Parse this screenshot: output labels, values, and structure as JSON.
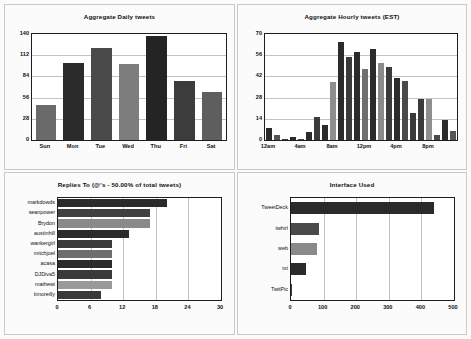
{
  "page": {
    "background": "#fbfbfb",
    "panel_border": "#c9c9c9"
  },
  "palette": {
    "dark": "#2b2b2b",
    "mid": "#565656",
    "light": "#8e8e8e",
    "axis": "#1d1d1d",
    "grid": "#c3c3c3"
  },
  "chart_data": [
    {
      "id": "aggregate-daily-tweets",
      "type": "bar",
      "orientation": "vertical",
      "title": "Aggregate Daily tweets",
      "xlabel": "",
      "ylabel": "",
      "categories": [
        "Sun",
        "Mon",
        "Tue",
        "Wed",
        "Thu",
        "Fri",
        "Sat"
      ],
      "values": [
        46,
        102,
        122,
        101,
        138,
        78,
        63
      ],
      "colors": [
        "#6a6a6a",
        "#2b2b2b",
        "#4a4a4a",
        "#7d7d7d",
        "#242424",
        "#3c3c3c",
        "#5e5e5e"
      ],
      "ylim": [
        0,
        140
      ],
      "yticks": [
        0,
        28,
        56,
        84,
        112,
        140
      ],
      "ytick_labels": [
        "0",
        "28",
        "56",
        "84",
        "112",
        "140"
      ],
      "grid": true,
      "legend": false
    },
    {
      "id": "aggregate-hourly-tweets",
      "type": "bar",
      "orientation": "vertical",
      "title": "Aggregate Hourly tweets (EST)",
      "xlabel": "",
      "ylabel": "",
      "categories": [
        "12am",
        "1am",
        "2am",
        "3am",
        "4am",
        "5am",
        "6am",
        "7am",
        "8am",
        "9am",
        "10am",
        "11am",
        "12pm",
        "1pm",
        "2pm",
        "3pm",
        "4pm",
        "5pm",
        "6pm",
        "7pm",
        "8pm",
        "9pm",
        "10pm",
        "11pm"
      ],
      "values": [
        8,
        3,
        1,
        2,
        1,
        5,
        15,
        10,
        38,
        65,
        55,
        58,
        47,
        60,
        51,
        48,
        41,
        39,
        18,
        27,
        27,
        3,
        13,
        6
      ],
      "colors": [
        "#2b2b2b",
        "#555555",
        "#3a3a3a",
        "#2b2b2b",
        "#4a4a4a",
        "#2b2b2b",
        "#3a3a3a",
        "#2b2b2b",
        "#8e8e8e",
        "#2b2b2b",
        "#3a3a3a",
        "#2b2b2b",
        "#6f6f6f",
        "#2b2b2b",
        "#8a8a8a",
        "#3a3a3a",
        "#2b2b2b",
        "#4a4a4a",
        "#3a3a3a",
        "#3a3a3a",
        "#8e8e8e",
        "#4a4a4a",
        "#2b2b2b",
        "#555555"
      ],
      "ylim": [
        0,
        70
      ],
      "yticks": [
        0,
        14,
        28,
        42,
        56,
        70
      ],
      "ytick_labels": [
        "0",
        "14",
        "28",
        "42",
        "56",
        "70"
      ],
      "xtick_labels": [
        "12am",
        "4am",
        "8am",
        "12pm",
        "4pm",
        "8pm"
      ],
      "xtick_indices": [
        0,
        4,
        8,
        12,
        16,
        20
      ],
      "grid": true,
      "legend": false
    },
    {
      "id": "replies-to",
      "type": "bar",
      "orientation": "horizontal",
      "title": "Replies To (@'s - 50.00% of total tweets)",
      "xlabel": "",
      "ylabel": "",
      "categories": [
        "markdowds",
        "seanpower",
        "Brydon",
        "austinhill",
        "wankergirl",
        "mitchjoel",
        "acasa",
        "DJDiva5",
        "mathewi",
        "timoreilly"
      ],
      "values": [
        20,
        17,
        17,
        13,
        10,
        10,
        10,
        10,
        10,
        8
      ],
      "colors": [
        "#2b2b2b",
        "#3f3f3f",
        "#8a8a8a",
        "#2b2b2b",
        "#3a3a3a",
        "#6e6e6e",
        "#2b2b2b",
        "#3a3a3a",
        "#9a9a9a",
        "#3a3a3a"
      ],
      "xlim": [
        0,
        30
      ],
      "xticks": [
        0,
        6,
        12,
        18,
        24,
        30
      ],
      "xtick_labels": [
        "0",
        "6",
        "12",
        "18",
        "24",
        "30"
      ],
      "grid": true,
      "legend": false
    },
    {
      "id": "interface-used",
      "type": "bar",
      "orientation": "horizontal",
      "title": "Interface Used",
      "xlabel": "",
      "ylabel": "",
      "categories": [
        "TweetDeck",
        "twhirl",
        "web",
        "txt",
        "TwitPic"
      ],
      "values": [
        440,
        85,
        80,
        45,
        2
      ],
      "colors": [
        "#2b2b2b",
        "#4a4a4a",
        "#8a8a8a",
        "#2b2b2b",
        "#3a3a3a"
      ],
      "xlim": [
        0,
        500
      ],
      "xticks": [
        0,
        100,
        200,
        300,
        400,
        500
      ],
      "xtick_labels": [
        "0",
        "100",
        "200",
        "300",
        "400",
        "500"
      ],
      "grid": true,
      "legend": false
    }
  ]
}
